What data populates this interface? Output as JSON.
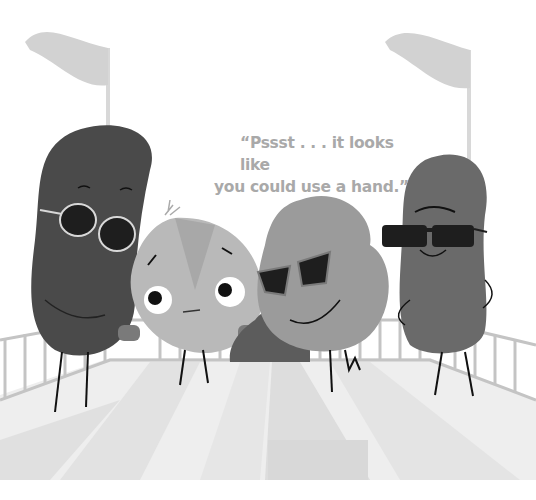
{
  "caption": {
    "line1": "“Pssst . . . it looks like",
    "line2": "you could use a hand.”"
  },
  "scene": {
    "description": "Four cartoon beans/vegetables on a deck with railing and two flags; three wear sunglasses",
    "colors": {
      "background": "#ffffff",
      "flag": "#d2d2d2",
      "dark_bean": "#4a4a4a",
      "right_bean": "#6a6a6a",
      "onion": "#b9b9b9",
      "potato": "#9b9b9b",
      "railing": "#c4c4c4",
      "floor_light": "#eeeeee",
      "floor_dark": "#dedede",
      "caption_text": "#a9a9a9"
    }
  }
}
